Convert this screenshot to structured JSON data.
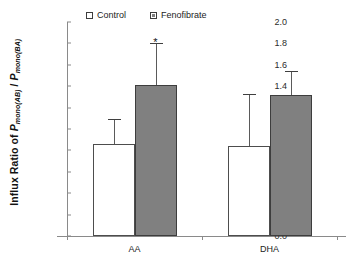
{
  "chart_data": {
    "type": "bar",
    "title": "",
    "xlabel": "",
    "ylabel": "Influx Ratio of Pmono(AB) / Pmono(BA)",
    "ylabel_parts": {
      "prefix": "Influx Ratio of ",
      "p1": "P",
      "p1_sub": "mono(AB)",
      "sep": " / ",
      "p2": "P",
      "p2_sub": "mono(BA)"
    },
    "categories": [
      "AA",
      "DHA"
    ],
    "ylim": [
      0.0,
      2.0
    ],
    "ytick_values": [
      2.0,
      1.8,
      1.6,
      1.4,
      1.2,
      1.0,
      0.8,
      0.6,
      0.4,
      0.2,
      0.0
    ],
    "ytick_labels": [
      "2.0",
      "1.8",
      "1.6",
      "1.4",
      "1.2",
      "1.0",
      "0.8",
      "0.6",
      "0.4",
      "0.2",
      "0.0"
    ],
    "grid": false,
    "legend_position": "top-center",
    "series": [
      {
        "name": "Control",
        "color": "#ffffff",
        "values": [
          0.86,
          0.84
        ],
        "errors": [
          0.23,
          0.49
        ]
      },
      {
        "name": "Fenofibrate",
        "color": "#808080",
        "values": [
          1.41,
          1.32
        ],
        "errors": [
          0.39,
          0.22
        ]
      }
    ],
    "annotations": [
      {
        "text": "*",
        "category": "AA",
        "series": "Fenofibrate",
        "y": 1.86,
        "meaning": "significant-difference-marker"
      }
    ]
  },
  "legend": {
    "items": [
      {
        "label": "Control",
        "swatch": "open-square"
      },
      {
        "label": "Fenofibrate",
        "swatch": "filled-square"
      }
    ]
  },
  "colors": {
    "control_fill": "#ffffff",
    "treatment_fill": "#808080",
    "bar_border": "#4d4d4d",
    "axis": "#8a8a8a",
    "text": "#1a1a1a",
    "background": "#ffffff"
  }
}
